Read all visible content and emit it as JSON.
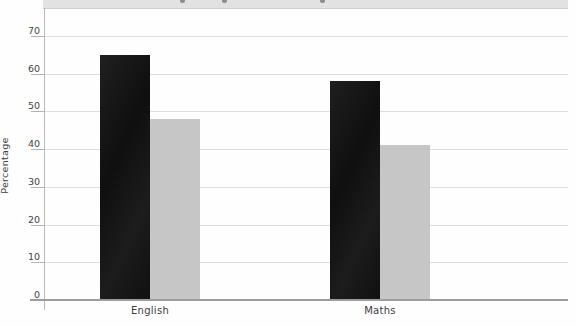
{
  "figure": {
    "width": 577,
    "height": 326
  },
  "chart_data": {
    "type": "bar",
    "title": "",
    "title_note": "title band cropped at top edge of screenshot; only letter descenders visible",
    "categories": [
      "English",
      "Maths"
    ],
    "series": [
      {
        "name": "black",
        "color": "#131313",
        "values": [
          65,
          58
        ]
      },
      {
        "name": "grey",
        "color": "#c6c6c6",
        "values": [
          48,
          41
        ]
      }
    ],
    "xlabel": "",
    "ylabel": "Percentage",
    "ylim": [
      0,
      77
    ],
    "yticks": [
      0,
      10,
      20,
      30,
      40,
      50,
      60,
      70
    ],
    "grid": true,
    "legend": "none",
    "layout": {
      "plot_left": 44,
      "plot_right": 568,
      "plot_top": 8,
      "axis_y": 300,
      "px_per_value": 3.7714,
      "band_left": 43,
      "band_height": 8,
      "group_centers": [
        150,
        380
      ],
      "bar_width": 50,
      "tick_len": 13,
      "descenders_x": [
        180,
        222,
        320
      ],
      "category_label_y": 305,
      "axis_overhang_left": 14,
      "yaxis_overhang_bottom": 10
    }
  }
}
